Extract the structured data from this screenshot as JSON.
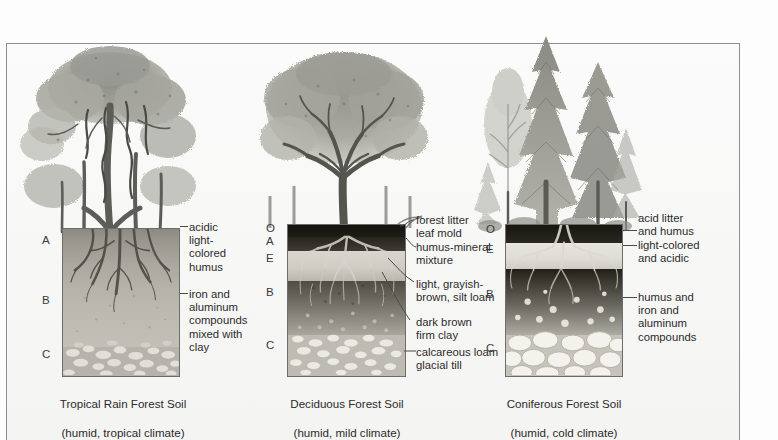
{
  "figure": {
    "frame_color": "#8e8e8e",
    "background": "#fdfdfd"
  },
  "panels": [
    {
      "id": "tropical",
      "caption_line1": "Tropical Rain Forest Soil",
      "caption_line2": "(humid, tropical climate)",
      "tree_type": "broadleaf-rainforest-canopy",
      "horizons": [
        {
          "letter": "A",
          "top": 234
        },
        {
          "letter": "B",
          "top": 294
        },
        {
          "letter": "C",
          "top": 348
        }
      ],
      "callouts": [
        {
          "text": "acidic\nlight-\ncolored\nhumus",
          "top": 221
        },
        {
          "text": "iron and\naluminum\ncompounds\nmixed with\nclay",
          "top": 288
        }
      ]
    },
    {
      "id": "deciduous",
      "caption_line1": "Deciduous Forest Soil",
      "caption_line2": "(humid, mild climate)",
      "tree_type": "broadleaf-deciduous-round-crown",
      "horizons": [
        {
          "letter": "O",
          "top": 222
        },
        {
          "letter": "A",
          "top": 235
        },
        {
          "letter": "E",
          "top": 252
        },
        {
          "letter": "B",
          "top": 286
        },
        {
          "letter": "C",
          "top": 339
        }
      ],
      "callouts": [
        {
          "text": "forest litter\nleaf mold",
          "top": 214
        },
        {
          "text": "humus-mineral\nmixture",
          "top": 241
        },
        {
          "text": "light, grayish-\nbrown, silt loam",
          "top": 278
        },
        {
          "text": "dark brown\nfirm clay",
          "top": 316
        },
        {
          "text": "calcareous loam\nglacial till",
          "top": 346
        }
      ]
    },
    {
      "id": "coniferous",
      "caption_line1": "Coniferous Forest Soil",
      "caption_line2": "(humid, cold climate)",
      "tree_type": "needleleaf-conifer-spire",
      "horizons": [
        {
          "letter": "O",
          "top": 223
        },
        {
          "letter": "E",
          "top": 243
        },
        {
          "letter": "B",
          "top": 288
        },
        {
          "letter": "C",
          "top": 342
        }
      ],
      "callouts": [
        {
          "text": "acid litter\nand humus",
          "top": 212
        },
        {
          "text": "light-colored\nand acidic",
          "top": 239
        },
        {
          "text": "humus and\niron and\naluminum\ncompounds",
          "top": 291
        }
      ]
    }
  ]
}
